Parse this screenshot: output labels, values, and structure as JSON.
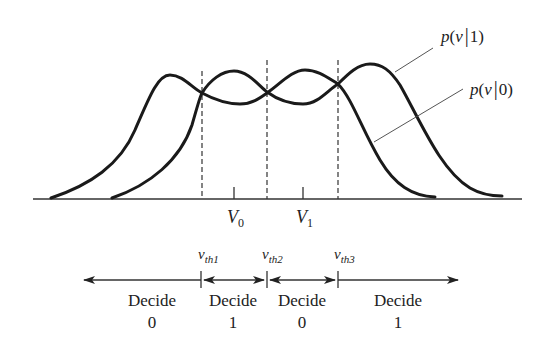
{
  "diagram": {
    "curves": [
      {
        "id": "p1",
        "label": "p(v|1)",
        "label_parts": {
          "fn": "p",
          "open": "(",
          "var": "v",
          "bar": "|",
          "cond": "1",
          "close": ")"
        }
      },
      {
        "id": "p0",
        "label": "p(v|0)",
        "label_parts": {
          "fn": "p",
          "open": "(",
          "var": "v",
          "bar": "|",
          "cond": "0",
          "close": ")"
        }
      }
    ],
    "axis_ticks": [
      {
        "label_main": "V",
        "label_sub": "0"
      },
      {
        "label_main": "V",
        "label_sub": "1"
      }
    ],
    "thresholds": [
      {
        "main": "v",
        "sub": "th1"
      },
      {
        "main": "v",
        "sub": "th2"
      },
      {
        "main": "v",
        "sub": "th3"
      }
    ],
    "decisions": [
      {
        "word": "Decide",
        "value": "0"
      },
      {
        "word": "Decide",
        "value": "1"
      },
      {
        "word": "Decide",
        "value": "0"
      },
      {
        "word": "Decide",
        "value": "1"
      }
    ]
  }
}
